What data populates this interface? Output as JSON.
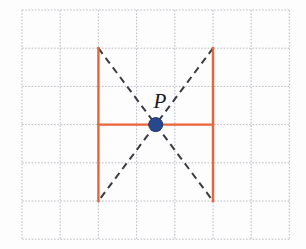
{
  "figure": {
    "background_color": "#fdfdfd",
    "width": 306,
    "height": 249
  },
  "grid": {
    "name": "dotted-square-grid",
    "color": "#b9bcc4",
    "line_style": "dotted",
    "line_width": 1,
    "columns": 7,
    "rows": 6,
    "cell_size": 38.2,
    "origin_x": 22,
    "origin_y": 10,
    "x_lines": [
      22,
      60.2,
      98.4,
      136.6,
      174.8,
      213,
      251.2,
      289.4
    ],
    "y_lines": [
      10,
      48.2,
      86.4,
      124.6,
      162.8,
      201,
      239.2
    ]
  },
  "shape": {
    "name": "orange-open-figure",
    "color": "#ec6338",
    "stroke_width": 2.4,
    "segments": [
      {
        "name": "left-vertical",
        "x1": 98.4,
        "y1": 48.2,
        "x2": 98.4,
        "y2": 201
      },
      {
        "name": "right-vertical",
        "x1": 213,
        "y1": 48.2,
        "x2": 213,
        "y2": 201
      },
      {
        "name": "horizontal-crossbar",
        "x1": 98.4,
        "y1": 124.6,
        "x2": 213,
        "y2": 124.6
      }
    ]
  },
  "dashed_lines": {
    "name": "diagonal-guides",
    "color": "#3a3a42",
    "stroke_width": 2,
    "dash_pattern": "7 5",
    "segments": [
      {
        "name": "diagonal-top-left-to-bottom-right",
        "x1": 98.4,
        "y1": 48.2,
        "x2": 213,
        "y2": 201
      },
      {
        "name": "diagonal-top-right-to-bottom-left",
        "x1": 213,
        "y1": 48.2,
        "x2": 98.4,
        "y2": 201
      }
    ]
  },
  "point": {
    "name": "point-P",
    "label": "P",
    "x": 155.7,
    "y": 124.6,
    "radius": 7,
    "fill_color": "#27488c",
    "stroke_color": "#1b3468",
    "label_x": 160,
    "label_y": 108
  }
}
